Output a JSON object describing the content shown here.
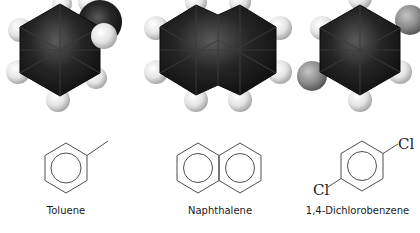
{
  "figure": {
    "colors": {
      "carbon": "#1c1c1c",
      "hydrogen": "#e6e6e6",
      "chlorine": "#8a8a8a",
      "bond_line": "#3a3a3a",
      "background": "#ffffff"
    },
    "molecules": [
      {
        "name": "Toluene",
        "model": "space-filling-toluene",
        "structure": "benzene ring with methyl substituent"
      },
      {
        "name": "Naphthalene",
        "model": "space-filling-naphthalene",
        "structure": "two fused benzene rings"
      },
      {
        "name": "1,4-Dichlorobenzene",
        "model": "space-filling-dichlorobenzene",
        "structure": "benzene ring with para chlorine substituents",
        "substituent_labels": [
          "Cl",
          "Cl"
        ]
      }
    ]
  }
}
